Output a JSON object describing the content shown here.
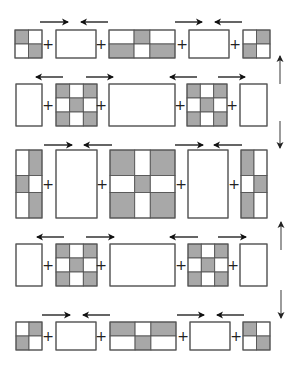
{
  "colors": {
    "shaded": "#a8a8a8",
    "blank": "#ffffff",
    "border": "#555555",
    "arrow": "#111111",
    "vertical_arrow": "#666666"
  },
  "plus_symbol": "+",
  "rows": [
    {
      "y": 30,
      "h": 28,
      "blocks": [
        {
          "x": 15,
          "w": 27,
          "cols": [
            0.5,
            0.5
          ],
          "rows": [
            0.5,
            0.5
          ],
          "pattern": [
            [
              1,
              0
            ],
            [
              0,
              1
            ]
          ]
        },
        {
          "x": 56,
          "w": 40,
          "cols": [
            1
          ],
          "rows": [
            1
          ],
          "pattern": [
            [
              0
            ]
          ]
        },
        {
          "x": 109,
          "w": 66,
          "cols": [
            0.38,
            0.24,
            0.38
          ],
          "rows": [
            0.5,
            0.5
          ],
          "pattern": [
            [
              0,
              1,
              0
            ],
            [
              1,
              0,
              1
            ]
          ]
        },
        {
          "x": 189,
          "w": 40,
          "cols": [
            1
          ],
          "rows": [
            1
          ],
          "pattern": [
            [
              0
            ]
          ]
        },
        {
          "x": 243,
          "w": 27,
          "cols": [
            0.5,
            0.5
          ],
          "rows": [
            0.5,
            0.5
          ],
          "pattern": [
            [
              0,
              1
            ],
            [
              1,
              0
            ]
          ]
        }
      ],
      "plus_x": [
        48,
        101,
        182,
        235
      ],
      "arrows_y": 22,
      "arrows": [
        {
          "x1": 40,
          "x2": 68,
          "dir": "right"
        },
        {
          "x1": 81,
          "x2": 108,
          "dir": "left"
        },
        {
          "x1": 175,
          "x2": 202,
          "dir": "right"
        },
        {
          "x1": 215,
          "x2": 242,
          "dir": "left"
        }
      ]
    },
    {
      "y": 84,
      "h": 42,
      "blocks": [
        {
          "x": 16,
          "w": 26,
          "cols": [
            1
          ],
          "rows": [
            1
          ],
          "pattern": [
            [
              0
            ]
          ]
        },
        {
          "x": 56,
          "w": 41,
          "cols": [
            0.333,
            0.334,
            0.333
          ],
          "rows": [
            0.333,
            0.334,
            0.333
          ],
          "pattern": [
            [
              1,
              0,
              1
            ],
            [
              0,
              1,
              0
            ],
            [
              1,
              0,
              1
            ]
          ]
        },
        {
          "x": 109,
          "w": 66,
          "cols": [
            1
          ],
          "rows": [
            1
          ],
          "pattern": [
            [
              0
            ]
          ]
        },
        {
          "x": 187,
          "w": 40,
          "cols": [
            0.333,
            0.334,
            0.333
          ],
          "rows": [
            0.333,
            0.334,
            0.333
          ],
          "pattern": [
            [
              1,
              0,
              1
            ],
            [
              0,
              1,
              0
            ],
            [
              1,
              0,
              1
            ]
          ]
        },
        {
          "x": 240,
          "w": 27,
          "cols": [
            1
          ],
          "rows": [
            1
          ],
          "pattern": [
            [
              0
            ]
          ]
        }
      ],
      "plus_x": [
        48,
        101,
        180,
        232
      ],
      "arrows_y": 77,
      "arrows": [
        {
          "x1": 36,
          "x2": 63,
          "dir": "left"
        },
        {
          "x1": 86,
          "x2": 113,
          "dir": "right"
        },
        {
          "x1": 170,
          "x2": 197,
          "dir": "left"
        },
        {
          "x1": 218,
          "x2": 245,
          "dir": "right"
        }
      ]
    },
    {
      "y": 150,
      "h": 68,
      "blocks": [
        {
          "x": 16,
          "w": 26,
          "cols": [
            0.5,
            0.5
          ],
          "rows": [
            0.375,
            0.25,
            0.375
          ],
          "pattern": [
            [
              0,
              1
            ],
            [
              1,
              0
            ],
            [
              0,
              1
            ]
          ]
        },
        {
          "x": 56,
          "w": 41,
          "cols": [
            1
          ],
          "rows": [
            1
          ],
          "pattern": [
            [
              0
            ]
          ]
        },
        {
          "x": 110,
          "w": 65,
          "cols": [
            0.38,
            0.24,
            0.38
          ],
          "rows": [
            0.375,
            0.25,
            0.375
          ],
          "pattern": [
            [
              1,
              0,
              1
            ],
            [
              0,
              1,
              0
            ],
            [
              1,
              0,
              1
            ]
          ]
        },
        {
          "x": 188,
          "w": 40,
          "cols": [
            1
          ],
          "rows": [
            1
          ],
          "pattern": [
            [
              0
            ]
          ]
        },
        {
          "x": 241,
          "w": 26,
          "cols": [
            0.5,
            0.5
          ],
          "rows": [
            0.375,
            0.25,
            0.375
          ],
          "pattern": [
            [
              1,
              0
            ],
            [
              0,
              1
            ],
            [
              1,
              0
            ]
          ]
        }
      ],
      "plus_x": [
        48,
        102,
        181,
        234
      ],
      "arrows_y": 145,
      "arrows": [
        {
          "x1": 44,
          "x2": 72,
          "dir": "right"
        },
        {
          "x1": 84,
          "x2": 112,
          "dir": "left"
        },
        {
          "x1": 175,
          "x2": 203,
          "dir": "right"
        },
        {
          "x1": 214,
          "x2": 242,
          "dir": "left"
        }
      ]
    },
    {
      "y": 244,
      "h": 42,
      "blocks": [
        {
          "x": 16,
          "w": 26,
          "cols": [
            1
          ],
          "rows": [
            1
          ],
          "pattern": [
            [
              0
            ]
          ]
        },
        {
          "x": 56,
          "w": 41,
          "cols": [
            0.333,
            0.334,
            0.333
          ],
          "rows": [
            0.333,
            0.334,
            0.333
          ],
          "pattern": [
            [
              1,
              0,
              1
            ],
            [
              0,
              1,
              0
            ],
            [
              1,
              0,
              1
            ]
          ]
        },
        {
          "x": 110,
          "w": 65,
          "cols": [
            1
          ],
          "rows": [
            1
          ],
          "pattern": [
            [
              0
            ]
          ]
        },
        {
          "x": 188,
          "w": 40,
          "cols": [
            0.333,
            0.334,
            0.333
          ],
          "rows": [
            0.333,
            0.334,
            0.333
          ],
          "pattern": [
            [
              1,
              0,
              1
            ],
            [
              0,
              1,
              0
            ],
            [
              1,
              0,
              1
            ]
          ]
        },
        {
          "x": 240,
          "w": 27,
          "cols": [
            1
          ],
          "rows": [
            1
          ],
          "pattern": [
            [
              0
            ]
          ]
        }
      ],
      "plus_x": [
        48,
        101,
        181,
        233
      ],
      "arrows_y": 237,
      "arrows": [
        {
          "x1": 37,
          "x2": 64,
          "dir": "left"
        },
        {
          "x1": 86,
          "x2": 114,
          "dir": "right"
        },
        {
          "x1": 170,
          "x2": 198,
          "dir": "left"
        },
        {
          "x1": 218,
          "x2": 246,
          "dir": "right"
        }
      ]
    },
    {
      "y": 322,
      "h": 28,
      "blocks": [
        {
          "x": 16,
          "w": 26,
          "cols": [
            0.5,
            0.5
          ],
          "rows": [
            0.5,
            0.5
          ],
          "pattern": [
            [
              0,
              1
            ],
            [
              1,
              0
            ]
          ]
        },
        {
          "x": 56,
          "w": 40,
          "cols": [
            1
          ],
          "rows": [
            1
          ],
          "pattern": [
            [
              0
            ]
          ]
        },
        {
          "x": 110,
          "w": 66,
          "cols": [
            0.38,
            0.24,
            0.38
          ],
          "rows": [
            0.5,
            0.5
          ],
          "pattern": [
            [
              1,
              0,
              1
            ],
            [
              0,
              1,
              0
            ]
          ]
        },
        {
          "x": 190,
          "w": 40,
          "cols": [
            1
          ],
          "rows": [
            1
          ],
          "pattern": [
            [
              0
            ]
          ]
        },
        {
          "x": 243,
          "w": 27,
          "cols": [
            0.5,
            0.5
          ],
          "rows": [
            0.5,
            0.5
          ],
          "pattern": [
            [
              1,
              0
            ],
            [
              0,
              1
            ]
          ]
        }
      ],
      "plus_x": [
        48,
        101,
        183,
        236
      ],
      "arrows_y": 315,
      "arrows": [
        {
          "x1": 42,
          "x2": 70,
          "dir": "right"
        },
        {
          "x1": 83,
          "x2": 110,
          "dir": "left"
        },
        {
          "x1": 177,
          "x2": 204,
          "dir": "right"
        },
        {
          "x1": 217,
          "x2": 244,
          "dir": "left"
        }
      ]
    }
  ],
  "vertical_arrows": [
    {
      "x": 280,
      "y1": 56,
      "y2": 84,
      "dir": "up"
    },
    {
      "x": 280,
      "y1": 121,
      "y2": 148,
      "dir": "down"
    },
    {
      "x": 281,
      "y1": 222,
      "y2": 250,
      "dir": "up"
    },
    {
      "x": 281,
      "y1": 290,
      "y2": 318,
      "dir": "down"
    }
  ]
}
